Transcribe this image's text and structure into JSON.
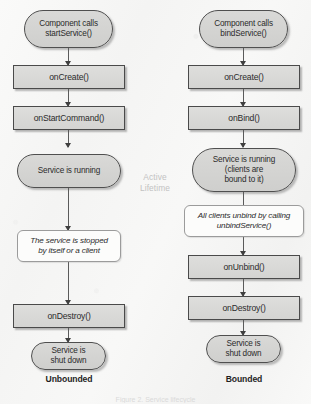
{
  "diagram": {
    "center_label": {
      "line1": "Active",
      "line2": "Lifetime"
    },
    "caption": "Figure 2. Service lifecycle",
    "colors": {
      "background": "#f7f7f6",
      "node_fill": "#d6d6d4",
      "node_border": "#4a4a4a",
      "note_fill": "#fcfcfb",
      "note_border": "#9b9b9b",
      "connector": "#5a5a5a",
      "center_label": "#c2c2c2",
      "text": "#2b2b2b"
    }
  },
  "columns": [
    {
      "name": "unbounded",
      "label": "Unbounded",
      "nodes": [
        {
          "id": "start-service",
          "shape": "stadium",
          "text": "Component calls\nstartService()"
        },
        {
          "id": "on-create",
          "shape": "rect",
          "text": "onCreate()"
        },
        {
          "id": "on-start-command",
          "shape": "rect",
          "text": "onStartCommand()"
        },
        {
          "id": "service-running",
          "shape": "stadium",
          "text": "Service is running"
        },
        {
          "id": "service-stopped-note",
          "shape": "note",
          "text": "The service is stopped\nby itself or a client"
        },
        {
          "id": "on-destroy",
          "shape": "rect",
          "text": "onDestroy()"
        },
        {
          "id": "service-shut-down",
          "shape": "stadium",
          "text": "Service is\nshut down"
        }
      ]
    },
    {
      "name": "bounded",
      "label": "Bounded",
      "nodes": [
        {
          "id": "bind-service",
          "shape": "stadium",
          "text": "Component calls\nbindService()"
        },
        {
          "id": "on-create",
          "shape": "rect",
          "text": "onCreate()"
        },
        {
          "id": "on-bind",
          "shape": "rect",
          "text": "onBind()"
        },
        {
          "id": "service-running",
          "shape": "stadium",
          "text": "Service is running\n(clients are\nbound to it)"
        },
        {
          "id": "clients-unbind-note",
          "shape": "note",
          "text": "All clients unbind by calling\nunbindService()"
        },
        {
          "id": "on-unbind",
          "shape": "rect",
          "text": "onUnbind()"
        },
        {
          "id": "on-destroy",
          "shape": "rect",
          "text": "onDestroy()"
        },
        {
          "id": "service-shut-down",
          "shape": "stadium",
          "text": "Service is\nshut down"
        }
      ]
    }
  ]
}
